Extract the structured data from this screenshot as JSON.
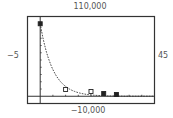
{
  "window": {
    "xmin_label": "−5",
    "xmax_label": "45",
    "ymin_label": "−10,000",
    "ymax_label": "110,000"
  },
  "chart_data": {
    "type": "scatter",
    "title": "",
    "xlabel": "",
    "ylabel": "",
    "xlim": [
      -5,
      45
    ],
    "ylim": [
      -10000,
      110000
    ],
    "x_tick_step": 5,
    "y_tick_step": 10000,
    "grid": false,
    "series": [
      {
        "name": "data points",
        "marker": "square",
        "x": [
          0,
          10,
          20,
          25,
          30
        ],
        "y": [
          100000,
          9300,
          6500,
          3800,
          2400
        ]
      },
      {
        "name": "exponential fit",
        "type": "line",
        "style": "dashed",
        "model": "y = 100000 * e^(-0.2x)"
      }
    ]
  }
}
